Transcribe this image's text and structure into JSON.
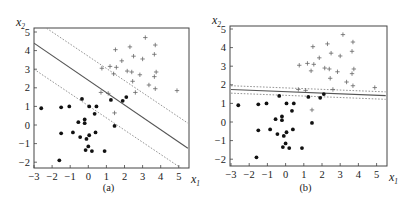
{
  "chart_data": [
    {
      "type": "scatter",
      "panel": "a",
      "caption": "(a)",
      "xlabel": "x1",
      "ylabel": "x2",
      "xlim": [
        -3,
        5.5
      ],
      "ylim": [
        -2.3,
        5.2
      ],
      "xticks": [
        -3,
        -2,
        -1,
        0,
        1,
        2,
        3,
        4,
        5
      ],
      "yticks": [
        -2,
        -1,
        0,
        1,
        2,
        3,
        4,
        5
      ],
      "grid": false,
      "series": [
        {
          "name": "class -1",
          "marker": "filled-circle",
          "points": [
            [
              -2.6,
              0.9
            ],
            [
              -1.5,
              0.95
            ],
            [
              -1.05,
              1.0
            ],
            [
              -0.35,
              1.4
            ],
            [
              0.05,
              1.0
            ],
            [
              0.45,
              1.0
            ],
            [
              0.35,
              0.6
            ],
            [
              1.25,
              1.35
            ],
            [
              1.9,
              1.3
            ],
            [
              2.1,
              1.5
            ],
            [
              1.45,
              -0.05
            ],
            [
              -0.55,
              0.15
            ],
            [
              -0.2,
              0.3
            ],
            [
              -0.2,
              0.1
            ],
            [
              -1.5,
              -0.45
            ],
            [
              -0.85,
              -0.4
            ],
            [
              -0.45,
              -0.65
            ],
            [
              -0.1,
              -0.75
            ],
            [
              0.05,
              -0.55
            ],
            [
              0.4,
              -0.4
            ],
            [
              0.0,
              -1.15
            ],
            [
              -0.15,
              -1.35
            ],
            [
              0.2,
              -1.4
            ],
            [
              0.9,
              -1.4
            ],
            [
              -1.6,
              -1.9
            ]
          ]
        },
        {
          "name": "class +1",
          "marker": "plus",
          "points": [
            [
              3.15,
              4.7
            ],
            [
              3.7,
              4.3
            ],
            [
              2.3,
              4.2
            ],
            [
              1.5,
              4.05
            ],
            [
              2.5,
              3.7
            ],
            [
              3.65,
              3.8
            ],
            [
              3.0,
              3.55
            ],
            [
              1.85,
              3.45
            ],
            [
              0.75,
              3.05
            ],
            [
              1.2,
              3.15
            ],
            [
              1.55,
              3.1
            ],
            [
              1.4,
              2.75
            ],
            [
              2.15,
              2.9
            ],
            [
              2.4,
              2.85
            ],
            [
              2.85,
              2.7
            ],
            [
              3.75,
              2.85
            ],
            [
              3.65,
              2.6
            ],
            [
              2.45,
              2.35
            ],
            [
              3.35,
              2.15
            ],
            [
              3.7,
              1.95
            ],
            [
              2.6,
              1.75
            ],
            [
              4.9,
              1.85
            ],
            [
              0.7,
              1.75
            ],
            [
              1.1,
              1.7
            ],
            [
              1.45,
              0.65
            ]
          ]
        }
      ],
      "lines": [
        {
          "name": "decision-boundary",
          "style": "solid",
          "from": [
            -3,
            4.4
          ],
          "to": [
            5.5,
            -1.25
          ]
        },
        {
          "name": "upper-margin",
          "style": "dotted",
          "from": [
            -2.3,
            5.2
          ],
          "to": [
            5.5,
            0.1
          ]
        },
        {
          "name": "lower-margin",
          "style": "dotted",
          "from": [
            -3,
            3.0
          ],
          "to": [
            5.1,
            -2.3
          ]
        }
      ]
    },
    {
      "type": "scatter",
      "panel": "b",
      "caption": "(b)",
      "xlabel": "x1",
      "ylabel": "x2",
      "xlim": [
        -3,
        5.5
      ],
      "ylim": [
        -2.3,
        5.2
      ],
      "xticks": [
        -3,
        -2,
        -1,
        0,
        1,
        2,
        3,
        4,
        5
      ],
      "yticks": [
        -2,
        -1,
        0,
        1,
        2,
        3,
        4,
        5
      ],
      "grid": false,
      "series": [
        {
          "name": "class -1",
          "marker": "filled-circle",
          "points": [
            [
              -2.6,
              0.9
            ],
            [
              -1.5,
              0.95
            ],
            [
              -1.05,
              1.0
            ],
            [
              -0.35,
              1.4
            ],
            [
              0.05,
              1.0
            ],
            [
              0.45,
              1.0
            ],
            [
              0.35,
              0.6
            ],
            [
              1.25,
              1.35
            ],
            [
              1.9,
              1.3
            ],
            [
              2.1,
              1.5
            ],
            [
              1.45,
              -0.05
            ],
            [
              -0.55,
              0.15
            ],
            [
              -0.2,
              0.3
            ],
            [
              -0.2,
              0.1
            ],
            [
              -1.5,
              -0.45
            ],
            [
              -0.85,
              -0.4
            ],
            [
              -0.45,
              -0.65
            ],
            [
              -0.1,
              -0.75
            ],
            [
              0.05,
              -0.55
            ],
            [
              0.4,
              -0.4
            ],
            [
              0.0,
              -1.15
            ],
            [
              -0.15,
              -1.35
            ],
            [
              0.2,
              -1.4
            ],
            [
              0.9,
              -1.4
            ],
            [
              -1.6,
              -1.9
            ]
          ]
        },
        {
          "name": "class +1",
          "marker": "plus",
          "points": [
            [
              3.15,
              4.7
            ],
            [
              3.7,
              4.3
            ],
            [
              2.3,
              4.2
            ],
            [
              1.5,
              4.05
            ],
            [
              2.5,
              3.7
            ],
            [
              3.65,
              3.8
            ],
            [
              3.0,
              3.55
            ],
            [
              1.85,
              3.45
            ],
            [
              0.75,
              3.05
            ],
            [
              1.2,
              3.15
            ],
            [
              1.55,
              3.1
            ],
            [
              1.4,
              2.75
            ],
            [
              2.15,
              2.9
            ],
            [
              2.4,
              2.85
            ],
            [
              2.85,
              2.7
            ],
            [
              3.75,
              2.85
            ],
            [
              3.65,
              2.6
            ],
            [
              2.45,
              2.35
            ],
            [
              3.35,
              2.15
            ],
            [
              3.7,
              1.95
            ],
            [
              2.6,
              1.75
            ],
            [
              4.9,
              1.85
            ],
            [
              0.7,
              1.75
            ],
            [
              1.1,
              1.7
            ],
            [
              1.45,
              0.65
            ]
          ]
        }
      ],
      "lines": [
        {
          "name": "decision-boundary",
          "style": "solid",
          "from": [
            -3,
            1.75
          ],
          "to": [
            5.5,
            1.42
          ]
        },
        {
          "name": "upper-margin",
          "style": "dotted",
          "from": [
            -3,
            1.95
          ],
          "to": [
            5.5,
            1.62
          ]
        },
        {
          "name": "lower-margin",
          "style": "dotted",
          "from": [
            -3,
            1.55
          ],
          "to": [
            5.5,
            1.22
          ]
        }
      ]
    }
  ],
  "colors": {
    "axis": "#444444",
    "solid_line": "#555555",
    "dotted_line": "#888888",
    "circle_marker": "#111111",
    "plus_marker": "#666666"
  }
}
